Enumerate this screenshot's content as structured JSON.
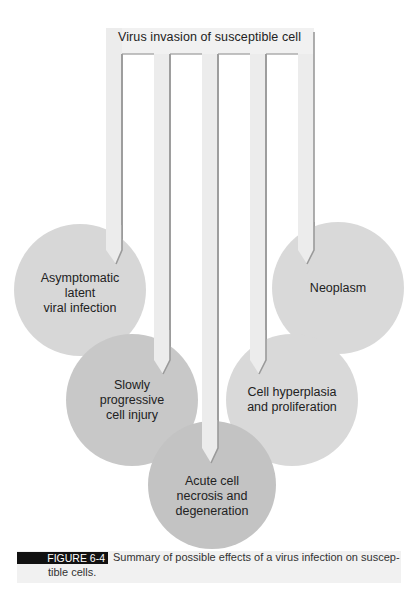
{
  "diagram": {
    "source": "Virus invasion of susceptible cell",
    "outcomes": [
      {
        "id": "asymptomatic",
        "lines": [
          "Asymptomatic",
          "latent",
          "viral infection"
        ],
        "fill": "#d7d7d7"
      },
      {
        "id": "slowly-progressive",
        "lines": [
          "Slowly",
          "progressive",
          "cell injury"
        ],
        "fill": "#c8c8c8"
      },
      {
        "id": "acute-necrosis",
        "lines": [
          "Acute cell",
          "necrosis and",
          "degeneration"
        ],
        "fill": "#c3c3c3"
      },
      {
        "id": "hyperplasia",
        "lines": [
          "Cell hyperplasia",
          "and proliferation"
        ],
        "fill": "#d9d9d9"
      },
      {
        "id": "neoplasm",
        "lines": [
          "Neoplasm"
        ],
        "fill": "#d9d9d9"
      }
    ]
  },
  "colors": {
    "header_box": "#f1f1f1",
    "arrow_fill": "#ececec",
    "arrow_edge": "#9a9a9a",
    "text": "#222222",
    "figure_tag_bg": "#111111",
    "figure_tag_text": "#ffffff"
  },
  "caption": {
    "label": "FIGURE 6-4",
    "line1": "Summary of possible effects of a virus infection on suscep-",
    "line2": "tible cells."
  }
}
